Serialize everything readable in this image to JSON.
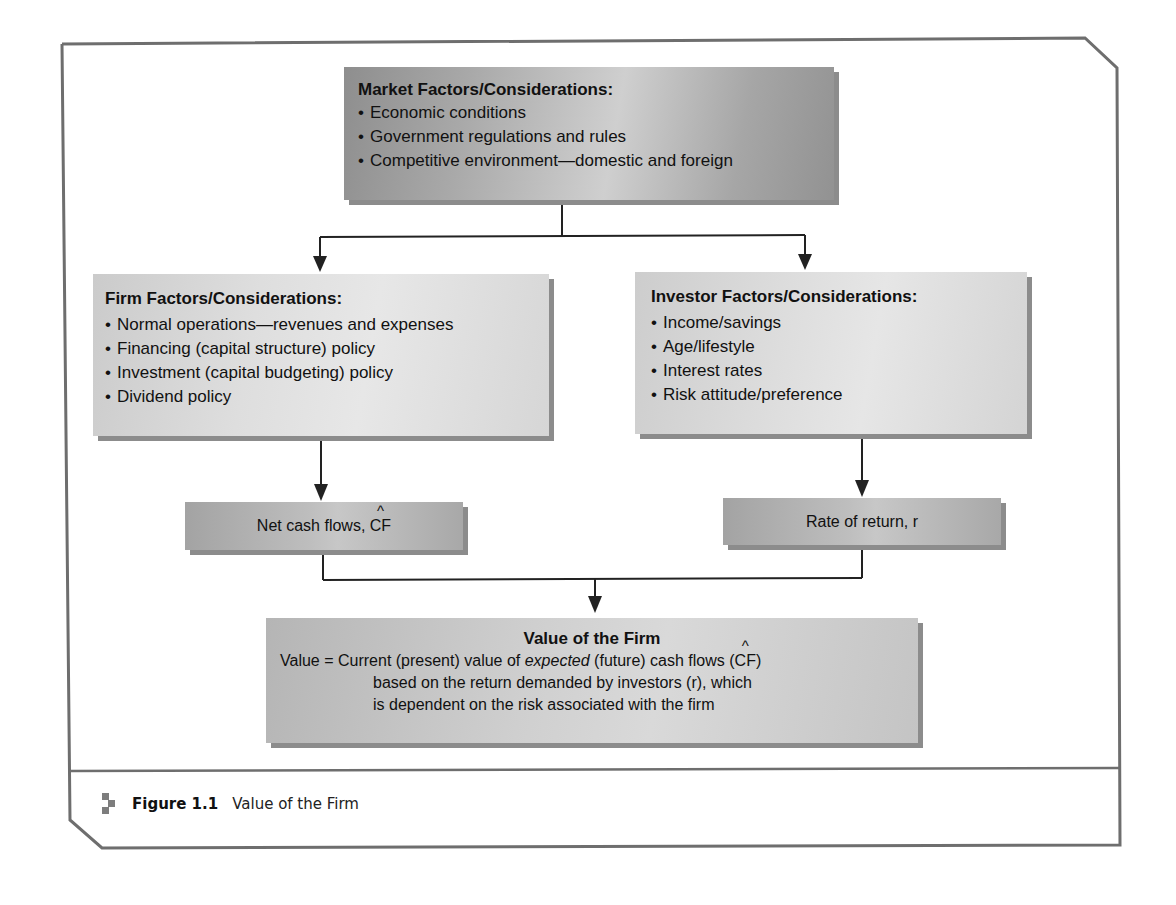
{
  "figure": {
    "label": "Figure 1.1",
    "caption": "Value of the Firm"
  },
  "market": {
    "title": "Market Factors/Considerations:",
    "items": [
      "Economic conditions",
      "Government regulations and rules",
      "Competitive environment—domestic and foreign"
    ]
  },
  "firm": {
    "title": "Firm Factors/Considerations:",
    "items": [
      "Normal operations—revenues and expenses",
      "Financing (capital structure) policy",
      "Investment (capital budgeting) policy",
      "Dividend policy"
    ]
  },
  "investor": {
    "title": "Investor Factors/Considerations:",
    "items": [
      "Income/savings",
      "Age/lifestyle",
      "Interest rates",
      "Risk attitude/preference"
    ]
  },
  "cash_flows": {
    "label_prefix": "Net cash flows, ",
    "symbol": "CF"
  },
  "rate_of_return": {
    "label": "Rate of return, r"
  },
  "value_box": {
    "title": "Value of the Firm",
    "line1_prefix": "Value = Current (present) value of ",
    "line1_italic": "expected",
    "line1_suffix": " (future) cash flows (",
    "line1_symbol": "CF",
    "line1_close": ")",
    "line2": "based on the return demanded by investors (r), which",
    "line3": "is dependent on the risk associated with the firm"
  },
  "bullet": "•",
  "colors": {
    "frame_line": "#6e6e6e",
    "arrow": "#222222",
    "shadow": "#8c8c8c"
  }
}
